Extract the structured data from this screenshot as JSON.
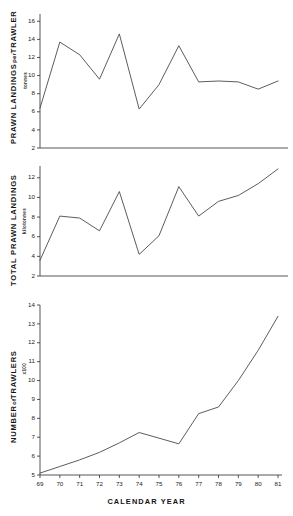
{
  "figure": {
    "xlabel": "CALENDAR YEAR",
    "xtick_labels": [
      "69",
      "70",
      "71",
      "72",
      "73",
      "74",
      "75",
      "76",
      "77",
      "78",
      "79",
      "80",
      "81"
    ]
  },
  "panels": {
    "top": {
      "title": "PRAWN LANDINGS",
      "title_mid": "per",
      "title_end": "TRAWLER",
      "units": "tonnes"
    },
    "middle": {
      "title": "TOTAL PRAWN LANDINGS",
      "units": "kilotonnes"
    },
    "bottom": {
      "title": "NUMBER",
      "title_mid": "of",
      "title_end": "TRAWLERS",
      "units": "x100"
    }
  },
  "chart_data": [
    {
      "type": "line",
      "title": "PRAWN LANDINGS per TRAWLER",
      "xlabel": "CALENDAR YEAR",
      "ylabel": "PRAWN LANDINGS per TRAWLER",
      "yunits": "tonnes",
      "x": [
        1969,
        1970,
        1971,
        1972,
        1973,
        1974,
        1975,
        1976,
        1977,
        1978,
        1979,
        1980,
        1981
      ],
      "xtick_labels": [
        "69",
        "70",
        "71",
        "72",
        "73",
        "74",
        "75",
        "76",
        "77",
        "78",
        "79",
        "80",
        "81"
      ],
      "ytick_labels": [
        "2",
        "4",
        "6",
        "8",
        "10",
        "12",
        "14",
        "16"
      ],
      "yticks": [
        2,
        4,
        6,
        8,
        10,
        12,
        14,
        16
      ],
      "ylim": [
        2,
        16.8
      ],
      "xlim": [
        1969,
        1981
      ],
      "values": [
        6.4,
        13.7,
        12.3,
        9.6,
        14.6,
        6.3,
        9.0,
        13.3,
        9.3,
        9.4,
        9.3,
        8.5,
        9.4
      ],
      "grid": false,
      "legend": null
    },
    {
      "type": "line",
      "title": "TOTAL PRAWN LANDINGS",
      "xlabel": "CALENDAR YEAR",
      "ylabel": "TOTAL PRAWN LANDINGS",
      "yunits": "kilotonnes",
      "x": [
        1969,
        1970,
        1971,
        1972,
        1973,
        1974,
        1975,
        1976,
        1977,
        1978,
        1979,
        1980,
        1981
      ],
      "xtick_labels": [
        "69",
        "70",
        "71",
        "72",
        "73",
        "74",
        "75",
        "76",
        "77",
        "78",
        "79",
        "80",
        "81"
      ],
      "ytick_labels": [
        "2",
        "4",
        "6",
        "8",
        "10",
        "12"
      ],
      "yticks": [
        2,
        4,
        6,
        8,
        10,
        12
      ],
      "ylim": [
        2,
        13.2
      ],
      "xlim": [
        1969,
        1981
      ],
      "values": [
        3.6,
        8.1,
        7.9,
        6.6,
        10.6,
        4.2,
        6.1,
        11.1,
        8.1,
        9.6,
        10.2,
        11.4,
        12.9
      ],
      "grid": false,
      "legend": null
    },
    {
      "type": "line",
      "title": "NUMBER of TRAWLERS x100",
      "xlabel": "CALENDAR YEAR",
      "ylabel": "NUMBER of TRAWLERS",
      "yunits": "x100",
      "x": [
        1969,
        1970,
        1971,
        1972,
        1973,
        1974,
        1975,
        1976,
        1977,
        1978,
        1979,
        1980,
        1981
      ],
      "xtick_labels": [
        "69",
        "70",
        "71",
        "72",
        "73",
        "74",
        "75",
        "76",
        "77",
        "78",
        "79",
        "80",
        "81"
      ],
      "ytick_labels": [
        "5",
        "6",
        "7",
        "8",
        "9",
        "10",
        "11",
        "12",
        "13",
        "14"
      ],
      "yticks": [
        5,
        6,
        7,
        8,
        9,
        10,
        11,
        12,
        13,
        14
      ],
      "ylim": [
        5,
        14
      ],
      "xlim": [
        1969,
        1981
      ],
      "values": [
        5.1,
        5.45,
        5.8,
        6.2,
        6.7,
        7.25,
        6.95,
        6.65,
        8.25,
        8.6,
        10.0,
        11.6,
        13.4
      ],
      "grid": false,
      "legend": null
    }
  ]
}
